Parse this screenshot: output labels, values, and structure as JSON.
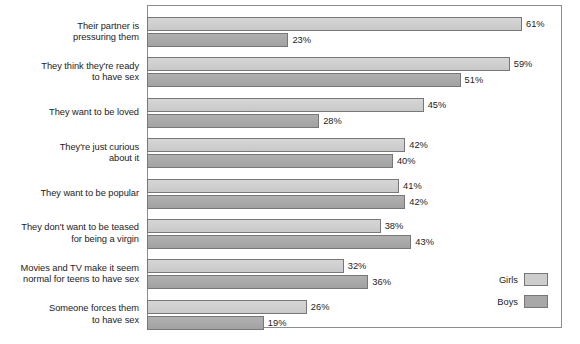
{
  "chart_data": {
    "type": "bar",
    "orientation": "horizontal",
    "title": "",
    "subtitle": "",
    "xlabel": "",
    "ylabel": "",
    "xlim": [
      0,
      67.5
    ],
    "grid": false,
    "legend_position": "bottom-right",
    "categories": [
      "Their partner is pressuring them",
      "They think they're ready to have sex",
      "They want to be loved",
      "They're just curious about it",
      "They want to be popular",
      "They don't want to be teased for being a virgin",
      "Movies and TV make it seem normal for teens to have sex",
      "Someone forces them to have sex"
    ],
    "category_lines": [
      [
        "Their partner is",
        "pressuring them"
      ],
      [
        "They think they're ready",
        "to have sex"
      ],
      [
        "They want to be loved"
      ],
      [
        "They're just curious",
        "about it"
      ],
      [
        "They want to be popular"
      ],
      [
        "They don't want to be teased",
        "for being a virgin"
      ],
      [
        "Movies and TV make it seem",
        "normal for teens to have sex"
      ],
      [
        "Someone forces them",
        "to have sex"
      ]
    ],
    "series": [
      {
        "name": "Girls",
        "color": "#cdcdcd",
        "values": [
          61,
          59,
          45,
          42,
          41,
          38,
          32,
          26
        ],
        "labels": [
          "61%",
          "59%",
          "45%",
          "42%",
          "41%",
          "38%",
          "32%",
          "26%"
        ]
      },
      {
        "name": "Boys",
        "color": "#a8a8a8",
        "values": [
          23,
          51,
          28,
          40,
          42,
          43,
          36,
          19
        ],
        "labels": [
          "23%",
          "51%",
          "28%",
          "40%",
          "42%",
          "43%",
          "36%",
          "19%"
        ]
      }
    ]
  },
  "legend": {
    "entries": [
      {
        "label": "Girls",
        "swatch": "girls"
      },
      {
        "label": "Boys",
        "swatch": "boys"
      }
    ]
  },
  "colors": {
    "girls": "#cdcdcd",
    "boys": "#a8a8a8",
    "frame": "#8c8c8c",
    "bar_outline": "#777777",
    "text": "#1c1c1c",
    "background": "#ffffff"
  }
}
